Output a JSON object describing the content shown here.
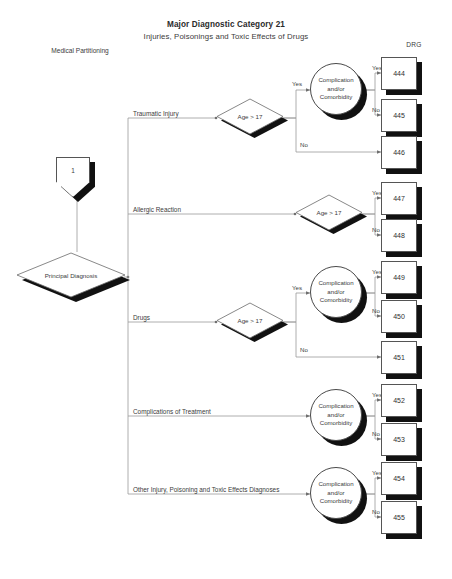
{
  "header": {
    "title": "Major Diagnostic Category 21",
    "subtitle": "Injuries, Poisonings and Toxic Effects of Drugs",
    "corner_label": "Medical Partitioning",
    "drg_column_header": "DRG"
  },
  "nodes": {
    "start": {
      "label": "1"
    },
    "principal_diagnosis": {
      "label": "Principal Diagnosis"
    },
    "age_traumatic": {
      "label": "Age > 17"
    },
    "age_allergic": {
      "label": "Age > 17"
    },
    "age_drugs": {
      "label": "Age > 17"
    },
    "cc_traumatic": {
      "label": "Complication and/or Comorbidity"
    },
    "cc_drugs": {
      "label": "Complication and/or Comorbidity"
    },
    "cc_complications": {
      "label": "Complication and/or Comorbidity"
    },
    "cc_other": {
      "label": "Complication and/or Comorbidity"
    }
  },
  "branches": [
    {
      "id": "traumatic-injury",
      "label": "Traumatic Injury"
    },
    {
      "id": "allergic-reaction",
      "label": "Allergic Reaction"
    },
    {
      "id": "drugs",
      "label": "Drugs"
    },
    {
      "id": "complications-of-treatment",
      "label": "Complications of Treatment"
    },
    {
      "id": "other-injury-poisoning",
      "label": "Other Injury, Poisoning and Toxic Effects Diagnoses"
    }
  ],
  "edge_labels": {
    "yes": "Yes",
    "no": "No"
  },
  "edges": [
    {
      "from": "age_traumatic",
      "to": "cc_traumatic",
      "label": "Yes"
    },
    {
      "from": "age_traumatic",
      "to": "drg_446",
      "label": "No"
    },
    {
      "from": "cc_traumatic",
      "to": "drg_444",
      "label": "Yes"
    },
    {
      "from": "cc_traumatic",
      "to": "drg_445",
      "label": "No"
    },
    {
      "from": "age_allergic",
      "to": "drg_447",
      "label": "Yes"
    },
    {
      "from": "age_allergic",
      "to": "drg_448",
      "label": "No"
    },
    {
      "from": "age_drugs",
      "to": "cc_drugs",
      "label": "Yes"
    },
    {
      "from": "age_drugs",
      "to": "drg_451",
      "label": "No"
    },
    {
      "from": "cc_drugs",
      "to": "drg_449",
      "label": "Yes"
    },
    {
      "from": "cc_drugs",
      "to": "drg_450",
      "label": "No"
    },
    {
      "from": "cc_complications",
      "to": "drg_452",
      "label": "Yes"
    },
    {
      "from": "cc_complications",
      "to": "drg_453",
      "label": "No"
    },
    {
      "from": "cc_other",
      "to": "drg_454",
      "label": "Yes"
    },
    {
      "from": "cc_other",
      "to": "drg_455",
      "label": "No"
    }
  ],
  "drg_boxes": [
    {
      "id": "drg_444",
      "code": "444"
    },
    {
      "id": "drg_445",
      "code": "445"
    },
    {
      "id": "drg_446",
      "code": "446"
    },
    {
      "id": "drg_447",
      "code": "447"
    },
    {
      "id": "drg_448",
      "code": "448"
    },
    {
      "id": "drg_449",
      "code": "449"
    },
    {
      "id": "drg_450",
      "code": "450"
    },
    {
      "id": "drg_451",
      "code": "451"
    },
    {
      "id": "drg_452",
      "code": "452"
    },
    {
      "id": "drg_453",
      "code": "453"
    },
    {
      "id": "drg_454",
      "code": "454"
    },
    {
      "id": "drg_455",
      "code": "455"
    }
  ],
  "colors": {
    "line": "#8c8c8c",
    "shadow": "#111111",
    "text": "#3b3b3b",
    "background": "#ffffff"
  }
}
